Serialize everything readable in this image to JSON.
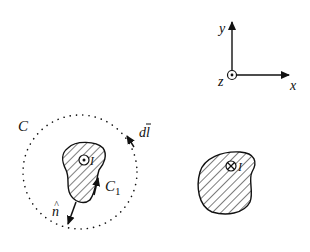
{
  "axes": {
    "x_label": "x",
    "y_label": "y",
    "z_label": "z",
    "z_symbol": "out-of-page (dot in circle)"
  },
  "loop_C": {
    "label": "C",
    "style": "dotted circle",
    "element_label": "dl",
    "element_label_hat": "̄"
  },
  "left_conductor": {
    "current_label": "I",
    "current_direction": "out-of-page",
    "contour_label": "C",
    "contour_subscript": "1",
    "normal_label": "n",
    "normal_hat": "^"
  },
  "right_conductor": {
    "current_label": "I",
    "current_direction": "into-page"
  },
  "colors": {
    "ink": "#111111",
    "background": "#ffffff"
  }
}
